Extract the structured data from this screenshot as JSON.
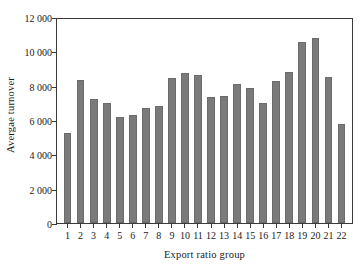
{
  "chart_data": {
    "type": "bar",
    "title": "",
    "subtitle": "",
    "xlabel": "Export ratio group",
    "ylabel": "Avergae turnover",
    "categories": [
      "1",
      "2",
      "3",
      "4",
      "5",
      "6",
      "7",
      "8",
      "9",
      "10",
      "11",
      "12",
      "13",
      "14",
      "15",
      "16",
      "17",
      "18",
      "19",
      "20",
      "21",
      "22"
    ],
    "values": [
      5300,
      8400,
      7300,
      7050,
      6250,
      6350,
      6750,
      6900,
      8550,
      8850,
      8700,
      7400,
      7500,
      8150,
      7950,
      7050,
      8350,
      8900,
      10650,
      10900,
      8600,
      5850
    ],
    "series": [
      {
        "name": "Average turnover",
        "values": [
          5300,
          8400,
          7300,
          7050,
          6250,
          6350,
          6750,
          6900,
          8550,
          8850,
          8700,
          7400,
          7500,
          8150,
          7950,
          7050,
          8350,
          8900,
          10650,
          10900,
          8600,
          5850
        ]
      }
    ],
    "ylim": [
      0,
      12000
    ],
    "yticks": [
      0,
      2000,
      4000,
      6000,
      8000,
      10000,
      12000
    ],
    "ytick_labels": [
      "0",
      "2 000",
      "4 000",
      "6 000",
      "8 000",
      "10 000",
      "12 000"
    ],
    "grid": false,
    "legend": null,
    "legend_position": "none",
    "bar_color": "#7a7a7a",
    "axis_color": "#3a3a3a",
    "background_color": "#ffffff"
  }
}
